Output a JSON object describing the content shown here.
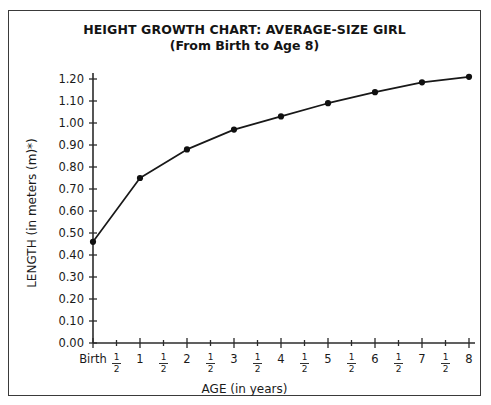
{
  "chart_data": {
    "type": "line",
    "title": "HEIGHT GROWTH CHART: AVERAGE-SIZE GIRL",
    "subtitle": "(From Birth to Age 8)",
    "xlabel": "AGE (in years)",
    "ylabel": "LENGTH (in meters (m)*)",
    "xlim": [
      0,
      8
    ],
    "ylim": [
      0.0,
      1.2
    ],
    "grid": false,
    "legend": null,
    "x": [
      0,
      1,
      2,
      3,
      4,
      5,
      6,
      7,
      8
    ],
    "values": [
      0.46,
      0.75,
      0.88,
      0.97,
      1.03,
      1.09,
      1.14,
      1.185,
      1.21
    ],
    "point_labels": [
      "Birth",
      "1",
      "2",
      "3",
      "4",
      "5",
      "6",
      "7",
      "8"
    ],
    "ytick_values": [
      0.0,
      0.1,
      0.2,
      0.3,
      0.4,
      0.5,
      0.6,
      0.7,
      0.8,
      0.9,
      1.0,
      1.1,
      1.2
    ],
    "ytick_labels": [
      "0.00",
      "0.10",
      "0.20",
      "0.30",
      "0.40",
      "0.50",
      "0.60",
      "0.70",
      "0.80",
      "0.90",
      "1.00",
      "1.10",
      "1.20"
    ],
    "xtick_values": [
      0,
      0.5,
      1,
      1.5,
      2,
      2.5,
      3,
      3.5,
      4,
      4.5,
      5,
      5.5,
      6,
      6.5,
      7,
      7.5,
      8
    ],
    "xtick_labels": [
      "Birth",
      "1/2",
      "1",
      "1/2",
      "2",
      "1/2",
      "3",
      "1/2",
      "4",
      "1/2",
      "5",
      "1/2",
      "6",
      "1/2",
      "7",
      "1/2",
      "8"
    ],
    "series_color": "#181818",
    "axis_color": "#2b2b2b",
    "border_color": "#3a3a3a",
    "background": "#ffffff"
  }
}
